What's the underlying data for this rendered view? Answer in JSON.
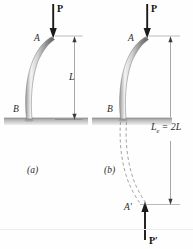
{
  "figure": {
    "type": "engineering-diagram",
    "background_color": "#fefefe",
    "ink_color": "#2a2a2a"
  },
  "panel_a": {
    "caption": "(a)",
    "load_label": "P",
    "top_point_label": "A",
    "base_point_label": "B",
    "dimension_label": "L"
  },
  "panel_b": {
    "caption": "(b)",
    "load_label": "P",
    "reaction_load_label": "P′",
    "top_point_label": "A",
    "base_point_label": "B",
    "mirror_point_label": "A′",
    "dimension_label": "L",
    "dimension_subscript": "e",
    "dimension_equals": "= 2L",
    "dimension_full": "Lₑ = 2L"
  },
  "colors": {
    "column_light": "#f2f2f2",
    "column_mid": "#bfbfbf",
    "column_dark": "#6e6e6e",
    "ground": "#b3b3b3",
    "arrow": "#1a1a1a",
    "dim_line": "#6a6a6a",
    "dashed": "#8a8a8a"
  }
}
